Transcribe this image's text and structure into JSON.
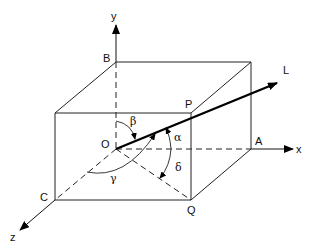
{
  "diagram": {
    "axes": {
      "x": "x",
      "y": "y",
      "z": "z"
    },
    "points": {
      "origin": "O",
      "back_top_left": "B",
      "x_axis_corner": "A",
      "z_axis_corner": "C",
      "top_front_right": "P",
      "bottom_front_right": "Q"
    },
    "line_label": "L",
    "angles": {
      "alpha": "α",
      "beta": "β",
      "gamma": "γ",
      "delta": "δ"
    },
    "colors": {
      "lines": "#222222",
      "background": "#ffffff"
    }
  }
}
